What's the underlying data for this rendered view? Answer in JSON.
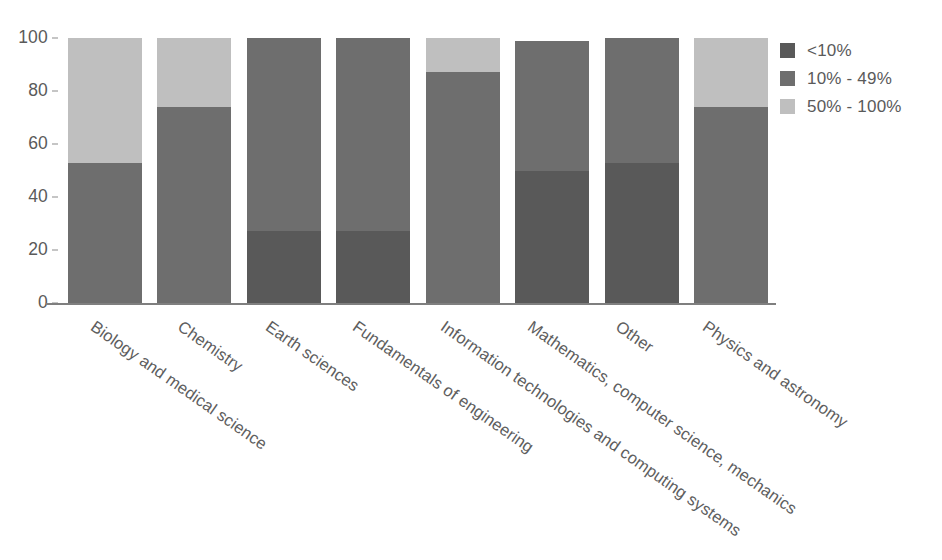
{
  "chart_data": {
    "type": "bar",
    "stacked": true,
    "title": "",
    "subtitle": "",
    "xlabel": "",
    "ylabel": "",
    "ylim": [
      0,
      100
    ],
    "yticks": [
      0,
      20,
      40,
      60,
      80,
      100
    ],
    "ytick_labels": [
      "0",
      "20",
      "40",
      "60",
      "80",
      "100"
    ],
    "grid": false,
    "legend_position": "right",
    "categories": [
      "Biology and medical science",
      "Chemistry",
      "Earth sciences",
      "Fundamentals of engineering",
      "Information technologies and computing systems",
      "Mathematics, computer science, mechanics",
      "Other",
      "Physics and astronomy"
    ],
    "series": [
      {
        "name": "<10%",
        "color": "#595959",
        "values": [
          0,
          0,
          27,
          27,
          0,
          50,
          53,
          0
        ]
      },
      {
        "name": "10% - 49%",
        "color": "#6e6e6e",
        "values": [
          53,
          74,
          73,
          73,
          87,
          49,
          47,
          74
        ]
      },
      {
        "name": "50% - 100%",
        "color": "#bfbfbf",
        "values": [
          47,
          26,
          0,
          0,
          13,
          0,
          0,
          26
        ]
      }
    ]
  },
  "legend": {
    "items": [
      {
        "label": "<10%",
        "color": "#595959"
      },
      {
        "label": "10% - 49%",
        "color": "#6e6e6e"
      },
      {
        "label": "50% - 100%",
        "color": "#bfbfbf"
      }
    ]
  },
  "axes": {
    "y_tick_labels": [
      "100",
      "80",
      "60",
      "40",
      "20",
      "0"
    ]
  }
}
